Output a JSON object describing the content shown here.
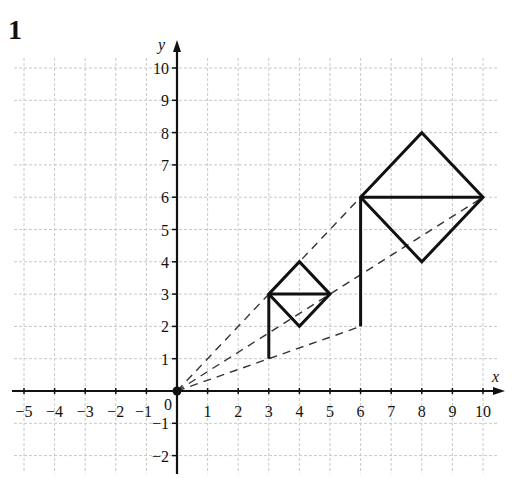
{
  "question_number": "1",
  "axes": {
    "x_label": "x",
    "y_label": "y",
    "origin_label": "0",
    "x_ticks": [
      -5,
      -4,
      -3,
      -2,
      -1,
      1,
      2,
      3,
      4,
      5,
      6,
      7,
      8,
      9,
      10
    ],
    "y_ticks": [
      -2,
      -1,
      1,
      2,
      3,
      4,
      5,
      6,
      7,
      8,
      9,
      10
    ],
    "x_range": [
      -5,
      10
    ],
    "y_range": [
      -2,
      10
    ]
  },
  "colors": {
    "grid": "#c8c8c8",
    "axis": "#111111",
    "shape": "#111111",
    "dashed": "#333333"
  },
  "centre_of_enlargement": [
    0,
    0
  ],
  "object_shape": {
    "stem": [
      [
        3,
        1
      ],
      [
        3,
        3
      ]
    ],
    "diamond": [
      [
        3,
        3
      ],
      [
        4,
        4
      ],
      [
        5,
        3
      ],
      [
        4,
        2
      ]
    ],
    "diagonal": [
      [
        3,
        3
      ],
      [
        5,
        3
      ]
    ]
  },
  "image_shape": {
    "stem": [
      [
        6,
        2
      ],
      [
        6,
        6
      ]
    ],
    "diamond": [
      [
        6,
        6
      ],
      [
        8,
        8
      ],
      [
        10,
        6
      ],
      [
        8,
        4
      ]
    ],
    "diagonal": [
      [
        6,
        6
      ],
      [
        10,
        6
      ]
    ]
  },
  "dashed_rays": [
    [
      [
        0,
        0
      ],
      [
        6,
        6
      ]
    ],
    [
      [
        0,
        0
      ],
      [
        10,
        6
      ]
    ],
    [
      [
        0,
        0
      ],
      [
        6,
        2
      ]
    ]
  ]
}
